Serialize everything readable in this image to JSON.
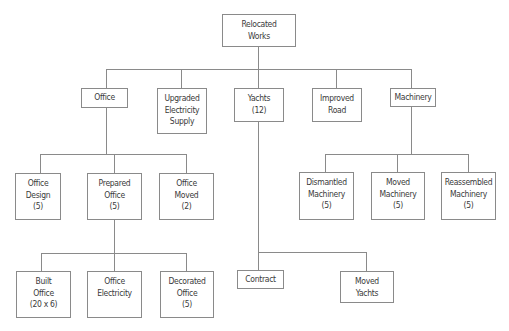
{
  "diagram": {
    "type": "work-breakdown-structure",
    "root": {
      "id": "relocated-works",
      "lines": [
        "Relocated",
        "Works"
      ]
    },
    "nodes": {
      "office": {
        "lines": [
          "Office"
        ]
      },
      "upgraded_electricity_supply": {
        "lines": [
          "Upgraded",
          "Electricity",
          "Supply"
        ]
      },
      "yachts": {
        "lines": [
          "Yachts",
          "(12)"
        ]
      },
      "improved_road": {
        "lines": [
          "Improved",
          "Road"
        ]
      },
      "machinery": {
        "lines": [
          "Machinery"
        ]
      },
      "office_design": {
        "lines": [
          "Office",
          "Design",
          "(5)"
        ]
      },
      "prepared_office": {
        "lines": [
          "Prepared",
          "Office",
          "(5)"
        ]
      },
      "office_moved": {
        "lines": [
          "Office",
          "Moved",
          "(2)"
        ]
      },
      "dismantled_machinery": {
        "lines": [
          "Dismantled",
          "Machinery",
          "(5)"
        ]
      },
      "moved_machinery": {
        "lines": [
          "Moved",
          "Machinery",
          "(5)"
        ]
      },
      "reassembled_machinery": {
        "lines": [
          "Reassembled",
          "Machinery",
          "(5)"
        ]
      },
      "built_office": {
        "lines": [
          "Built",
          "Office",
          "(20 x 6)"
        ]
      },
      "office_electricity": {
        "lines": [
          "Office",
          "Electricity"
        ]
      },
      "decorated_office": {
        "lines": [
          "Decorated",
          "Office",
          "(5)"
        ]
      },
      "contract": {
        "lines": [
          "Contract"
        ]
      },
      "moved_yachts": {
        "lines": [
          "Moved",
          "Yachts"
        ]
      }
    },
    "edges": [
      [
        "relocated-works",
        "office"
      ],
      [
        "relocated-works",
        "upgraded_electricity_supply"
      ],
      [
        "relocated-works",
        "yachts"
      ],
      [
        "relocated-works",
        "improved_road"
      ],
      [
        "relocated-works",
        "machinery"
      ],
      [
        "office",
        "office_design"
      ],
      [
        "office",
        "prepared_office"
      ],
      [
        "office",
        "office_moved"
      ],
      [
        "prepared_office",
        "built_office"
      ],
      [
        "prepared_office",
        "office_electricity"
      ],
      [
        "prepared_office",
        "decorated_office"
      ],
      [
        "yachts",
        "contract"
      ],
      [
        "yachts",
        "moved_yachts"
      ],
      [
        "machinery",
        "dismantled_machinery"
      ],
      [
        "machinery",
        "moved_machinery"
      ],
      [
        "machinery",
        "reassembled_machinery"
      ]
    ],
    "colors": {
      "border": "#8a8a8a",
      "text": "#3a3a3a",
      "background": "#ffffff"
    }
  }
}
